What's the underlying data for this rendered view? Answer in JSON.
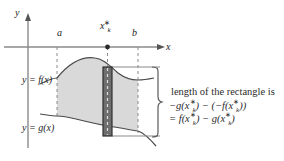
{
  "figure": {
    "background": "#ffffff",
    "axes": {
      "y_label": "y",
      "x_label": "x",
      "axis_color": "#8a8a8a",
      "origin": {
        "x": 28,
        "y": 47
      }
    },
    "tick_labels": {
      "a": "a",
      "b": "b",
      "xk_base": "x",
      "xk_star": "∗",
      "xk_sub": "k"
    },
    "curve_labels": {
      "f": "y = f(x)",
      "g": "y = g(x)"
    },
    "region": {
      "fill_color": "#d9d9d9",
      "stroke_color": "#4a4a4a"
    },
    "rectangle": {
      "fill_color": "#6e6e6e",
      "edge_color": "#2f2f2f",
      "dash_color": "#d8d8d8",
      "x_left": 103,
      "x_right": 112,
      "y_top": 67,
      "y_bottom": 136
    },
    "dashed_lines": {
      "color": "#8c8c8c",
      "positions": [
        57,
        107,
        138
      ]
    },
    "brace": {
      "color": "#5a5a5a",
      "top": 67,
      "bottom": 137,
      "x": 160
    },
    "annotation": {
      "line1": "length of the rectangle is",
      "line2_parts": {
        "lead": "−g(x",
        "star1": "∗",
        "sub1": "k",
        "mid": ") − (−f(x",
        "star2": "∗",
        "sub2": "k",
        "tail": "))"
      },
      "line3_parts": {
        "lead": "= f(x",
        "star1": "∗",
        "sub1": "k",
        "mid": ") − g(x",
        "star2": "∗",
        "sub2": "k",
        "tail": ")"
      }
    }
  }
}
